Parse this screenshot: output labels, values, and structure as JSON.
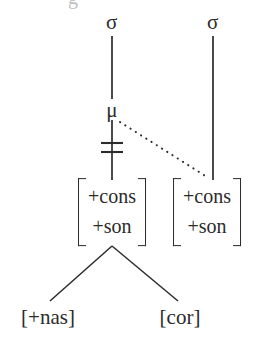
{
  "diagram": {
    "type": "autosegmental-phonological-tree",
    "width": 267,
    "height": 343,
    "background_color": "#ffffff",
    "stroke_color": "#2b2b2b",
    "clipped_top_glyph": "g"
  },
  "nodes": {
    "sigma_left": {
      "label": "σ",
      "name": "syllable",
      "x": 112,
      "y": 22
    },
    "sigma_right": {
      "label": "σ",
      "name": "syllable",
      "x": 213,
      "y": 22
    },
    "mu": {
      "label": "μ",
      "name": "mora",
      "x": 112,
      "y": 110
    }
  },
  "matrices": [
    {
      "id": "matrix-left",
      "x": 112,
      "y": 212,
      "rows": [
        "+cons",
        "+son"
      ]
    },
    {
      "id": "matrix-right",
      "x": 207,
      "y": 212,
      "rows": [
        "+cons",
        "+son"
      ]
    }
  ],
  "terminals": [
    {
      "id": "terminal-nas",
      "label": "[+nas]",
      "x": 48,
      "y": 317
    },
    {
      "id": "terminal-cor",
      "label": "[cor]",
      "x": 180,
      "y": 317
    }
  ],
  "edges": [
    {
      "id": "edge-sigma-left-to-mu",
      "from": "sigma_left",
      "to": "mu",
      "style": "solid",
      "x1": 112,
      "y1": 36,
      "x2": 112,
      "y2": 99
    },
    {
      "id": "edge-mu-to-matrix-left",
      "from": "mu",
      "to": "matrix-left",
      "style": "solid",
      "delinked": true,
      "x1": 112,
      "y1": 120,
      "x2": 112,
      "y2": 180
    },
    {
      "id": "edge-sigma-right-to-matrix-right",
      "from": "sigma_right",
      "to": "matrix-right",
      "style": "solid",
      "x1": 213,
      "y1": 36,
      "x2": 213,
      "y2": 180
    },
    {
      "id": "edge-mu-to-matrix-right-dotted",
      "from": "mu",
      "to": "matrix-right",
      "style": "dotted",
      "x1": 120,
      "y1": 122,
      "x2": 207,
      "y2": 177
    },
    {
      "id": "edge-matrix-left-to-nas",
      "from": "matrix-left",
      "to": "terminal-nas",
      "style": "solid",
      "x1": 112,
      "y1": 246,
      "x2": 50,
      "y2": 301
    },
    {
      "id": "edge-matrix-left-to-cor",
      "from": "matrix-left",
      "to": "terminal-cor",
      "style": "solid",
      "x1": 112,
      "y1": 246,
      "x2": 178,
      "y2": 301
    }
  ],
  "delink_mark": {
    "id": "delink-double-bar",
    "symbol": "=",
    "meaning": "association line severed",
    "center_x": 112,
    "bar1_y": 143,
    "bar2_y": 152,
    "half_width": 11
  }
}
